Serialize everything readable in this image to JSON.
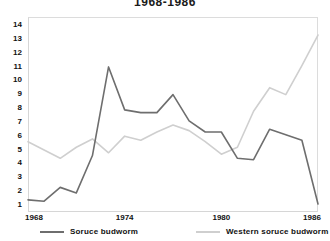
{
  "chart_data": {
    "type": "line",
    "title": "1968-1986",
    "xlabel": "",
    "ylabel": "",
    "xlim": [
      1968,
      1986
    ],
    "ylim": [
      1,
      14
    ],
    "grid": false,
    "legend_position": "bottom",
    "y_ticks": [
      14,
      13,
      12,
      11,
      10,
      9,
      8,
      7,
      6,
      5,
      4,
      3,
      2,
      1
    ],
    "x_ticks": [
      1968,
      1974,
      1980,
      1986
    ],
    "x": [
      1968,
      1969,
      1970,
      1971,
      1972,
      1973,
      1974,
      1975,
      1976,
      1977,
      1978,
      1979,
      1980,
      1981,
      1982,
      1983,
      1984,
      1985,
      1986
    ],
    "series": [
      {
        "name": "Soruce budworm",
        "color": "#6e6e6e",
        "values": [
          1.3,
          1.2,
          2.2,
          1.8,
          4.5,
          10.9,
          7.8,
          7.6,
          7.6,
          8.9,
          7.0,
          6.2,
          6.2,
          4.3,
          4.2,
          6.4,
          6.0,
          5.6,
          1.0
        ]
      },
      {
        "name": "Western soruce budworm",
        "color": "#cfcfcf",
        "values": [
          5.5,
          4.9,
          4.3,
          5.1,
          5.7,
          4.7,
          5.9,
          5.6,
          6.2,
          6.7,
          6.3,
          5.5,
          4.6,
          5.1,
          7.7,
          9.4,
          8.9,
          11.0,
          13.2
        ]
      }
    ]
  },
  "legend": {
    "items": [
      {
        "label": "Soruce budworm",
        "color": "#6e6e6e"
      },
      {
        "label": "Western soruce budworm",
        "color": "#cfcfcf"
      }
    ]
  },
  "axes": {
    "y_labels": [
      "14",
      "13",
      "12",
      "11",
      "10",
      "9",
      "8",
      "7",
      "6",
      "5",
      "4",
      "3",
      "2",
      "1"
    ],
    "x_labels": [
      "1968",
      "1974",
      "1980",
      "1986"
    ]
  },
  "colors": {
    "frame": "#d6d6d6",
    "text": "#111111",
    "background": "#ffffff"
  }
}
